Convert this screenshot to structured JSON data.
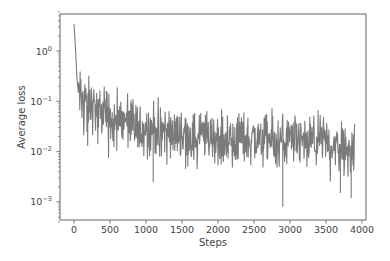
{
  "chart_data": {
    "type": "line",
    "title": "",
    "xlabel": "Steps",
    "ylabel": "Average loss",
    "yscale": "log",
    "xlim": [
      -200,
      4080
    ],
    "ylim": [
      0.0004,
      6
    ],
    "xticks": [
      0,
      500,
      1000,
      1500,
      2000,
      2500,
      3000,
      3500,
      4000
    ],
    "xtick_labels": [
      "0",
      "500",
      "1000",
      "1500",
      "2000",
      "2500",
      "3000",
      "3500",
      "4000"
    ],
    "yticks": [
      1,
      0.1,
      0.01,
      0.001
    ],
    "ytick_labels": [
      {
        "base": "10",
        "exp": "0"
      },
      {
        "base": "10",
        "exp": "−1"
      },
      {
        "base": "10",
        "exp": "−2"
      },
      {
        "base": "10",
        "exp": "−3"
      }
    ],
    "grid": false,
    "legend": null,
    "series": [
      {
        "name": "Average loss",
        "color": "#7a7a7a",
        "x": [
          0,
          20,
          40,
          60,
          80,
          100,
          150,
          200,
          250,
          300,
          350,
          400,
          450,
          500,
          600,
          700,
          800,
          900,
          1000,
          1100,
          1200,
          1300,
          1400,
          1500,
          1600,
          1700,
          1800,
          1900,
          2000,
          2100,
          2200,
          2300,
          2400,
          2500,
          2600,
          2700,
          2800,
          2900,
          3000,
          3100,
          3200,
          3300,
          3400,
          3500,
          3600,
          3700,
          3800,
          3900
        ],
        "values": [
          3.4,
          1.2,
          0.3,
          0.15,
          0.12,
          0.13,
          0.1,
          0.09,
          0.08,
          0.07,
          0.06,
          0.06,
          0.05,
          0.05,
          0.04,
          0.04,
          0.035,
          0.03,
          0.03,
          0.03,
          0.028,
          0.025,
          0.025,
          0.022,
          0.02,
          0.02,
          0.02,
          0.02,
          0.018,
          0.018,
          0.02,
          0.02,
          0.018,
          0.018,
          0.017,
          0.017,
          0.016,
          0.017,
          0.016,
          0.016,
          0.016,
          0.015,
          0.016,
          0.015,
          0.015,
          0.014,
          0.014,
          0.013
        ],
        "noise_band_decades": 0.45,
        "notable_spikes": [
          {
            "x": 450,
            "y": 0.16
          },
          {
            "x": 1100,
            "y": 0.0025
          },
          {
            "x": 2900,
            "y": 0.0008
          },
          {
            "x": 3700,
            "y": 0.0015
          },
          {
            "x": 3850,
            "y": 0.0012
          }
        ]
      }
    ]
  }
}
